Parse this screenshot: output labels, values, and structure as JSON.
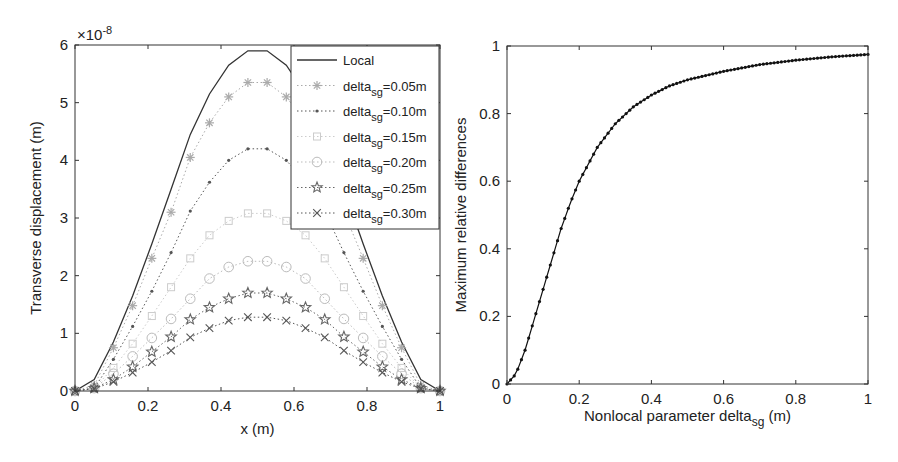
{
  "chart_data": [
    {
      "type": "line",
      "title": "",
      "xlabel": "x (m)",
      "ylabel": "Transverse displacement (m)",
      "y_exponent_label": "×10^-8",
      "y_exponent": {
        "base": "×10",
        "power": "-8"
      },
      "xlim": [
        0,
        1
      ],
      "ylim": [
        0,
        6
      ],
      "xticks": [
        "0",
        "0.2",
        "0.4",
        "0.6",
        "0.8",
        "1"
      ],
      "yticks": [
        "0",
        "1",
        "2",
        "3",
        "4",
        "5",
        "6"
      ],
      "grid": false,
      "legend_position": "upper right",
      "x": [
        0,
        0.0526,
        0.1053,
        0.1579,
        0.2105,
        0.2632,
        0.3158,
        0.3684,
        0.4211,
        0.4737,
        0.5263,
        0.5789,
        0.6316,
        0.6842,
        0.7368,
        0.7895,
        0.8421,
        0.8947,
        0.9474,
        1.0
      ],
      "series": [
        {
          "name": "Local",
          "sub": "",
          "suffix": "",
          "marker": "none",
          "line": "solid",
          "color": "#333333",
          "values": [
            0,
            0.2,
            0.85,
            1.65,
            2.55,
            3.5,
            4.45,
            5.15,
            5.65,
            5.9,
            5.9,
            5.65,
            5.15,
            4.45,
            3.5,
            2.55,
            1.65,
            0.85,
            0.2,
            0
          ]
        },
        {
          "name": "delta",
          "sub": "sg",
          "suffix": "=0.05m",
          "marker": "asterisk",
          "line": "dotted",
          "color": "#aaaaaa",
          "values": [
            0,
            0.1,
            0.75,
            1.48,
            2.3,
            3.1,
            4.05,
            4.65,
            5.1,
            5.35,
            5.35,
            5.1,
            4.65,
            4.05,
            3.1,
            2.3,
            1.48,
            0.75,
            0.1,
            0
          ]
        },
        {
          "name": "delta",
          "sub": "sg",
          "suffix": "=0.10m",
          "marker": "dot",
          "line": "dotted",
          "color": "#555555",
          "values": [
            0,
            0.05,
            0.55,
            1.12,
            1.73,
            2.4,
            3.12,
            3.62,
            4.0,
            4.2,
            4.2,
            4.0,
            3.62,
            3.12,
            2.4,
            1.73,
            1.12,
            0.55,
            0.05,
            0
          ]
        },
        {
          "name": "delta",
          "sub": "sg",
          "suffix": "=0.15m",
          "marker": "square",
          "line": "dotted",
          "color": "#cccccc",
          "values": [
            0,
            0.05,
            0.4,
            0.82,
            1.3,
            1.8,
            2.3,
            2.7,
            2.95,
            3.08,
            3.08,
            2.95,
            2.7,
            2.3,
            1.8,
            1.3,
            0.82,
            0.4,
            0.05,
            0
          ]
        },
        {
          "name": "delta",
          "sub": "sg",
          "suffix": "=0.20m",
          "marker": "circle",
          "line": "dotted",
          "color": "#bbbbbb",
          "values": [
            0,
            0.05,
            0.3,
            0.6,
            0.92,
            1.25,
            1.6,
            1.95,
            2.15,
            2.25,
            2.25,
            2.15,
            1.95,
            1.6,
            1.25,
            0.92,
            0.6,
            0.3,
            0.05,
            0
          ]
        },
        {
          "name": "delta",
          "sub": "sg",
          "suffix": "=0.25m",
          "marker": "star",
          "line": "dotted",
          "color": "#666666",
          "values": [
            0,
            0.05,
            0.2,
            0.42,
            0.68,
            0.94,
            1.24,
            1.45,
            1.6,
            1.7,
            1.7,
            1.6,
            1.45,
            1.24,
            0.94,
            0.68,
            0.42,
            0.2,
            0.05,
            0
          ]
        },
        {
          "name": "delta",
          "sub": "sg",
          "suffix": "=0.30m",
          "marker": "x",
          "line": "dotted",
          "color": "#555555",
          "values": [
            0,
            0.04,
            0.16,
            0.32,
            0.5,
            0.7,
            0.93,
            1.09,
            1.22,
            1.28,
            1.28,
            1.22,
            1.09,
            0.93,
            0.7,
            0.5,
            0.32,
            0.16,
            0.04,
            0
          ]
        }
      ]
    },
    {
      "type": "line",
      "title": "",
      "xlabel": "Nonlocal parameter delta_sg (m)",
      "xlabel_parts": {
        "main": "Nonlocal parameter delta",
        "sub": "sg",
        "suffix": " (m)"
      },
      "ylabel": "Maximum relative differences",
      "xlim": [
        0,
        1
      ],
      "ylim": [
        0,
        1
      ],
      "xticks": [
        "0",
        "0.2",
        "0.4",
        "0.6",
        "0.8",
        "1"
      ],
      "yticks": [
        "0",
        "0.2",
        "0.4",
        "0.6",
        "0.8",
        "1"
      ],
      "grid": false,
      "x": [
        0,
        0.025,
        0.05,
        0.075,
        0.1,
        0.125,
        0.15,
        0.175,
        0.2,
        0.25,
        0.3,
        0.35,
        0.4,
        0.45,
        0.5,
        0.6,
        0.7,
        0.8,
        0.9,
        1.0
      ],
      "series": [
        {
          "name": "Maximum relative difference",
          "marker": "dot",
          "line": "solid",
          "color": "#111111",
          "values": [
            0,
            0.03,
            0.1,
            0.19,
            0.28,
            0.37,
            0.46,
            0.535,
            0.6,
            0.7,
            0.77,
            0.82,
            0.855,
            0.882,
            0.9,
            0.925,
            0.945,
            0.958,
            0.968,
            0.975
          ]
        }
      ]
    }
  ]
}
